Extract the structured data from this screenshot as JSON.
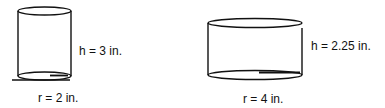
{
  "figures": [
    {
      "name": "small-cylinder",
      "height_label": "h = 3 in.",
      "radius_label": "r = 2 in."
    },
    {
      "name": "large-cylinder",
      "height_label": "h = 2.25 in.",
      "radius_label": "r = 4 in."
    }
  ],
  "colors": {
    "stroke": "#111111",
    "background": "#ffffff"
  }
}
